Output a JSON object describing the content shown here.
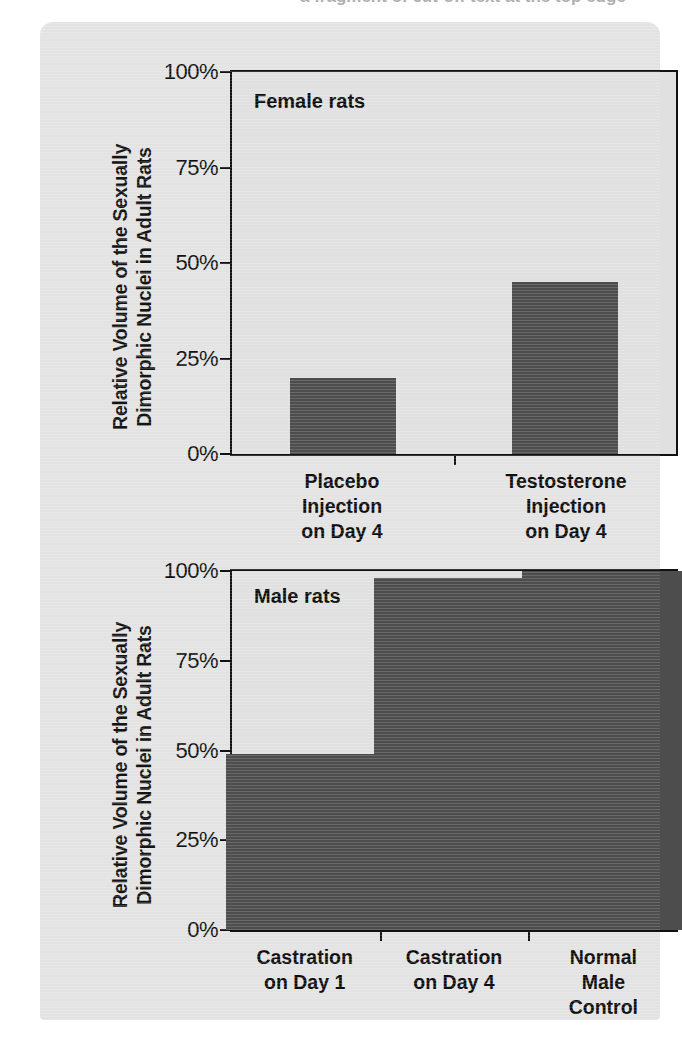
{
  "page": {
    "clipped_header_text": "a fragment of cut-off text at the top edge",
    "card_color": "#e3e3e3",
    "bar_color": "#4d4d4d",
    "plot_background": "#e0e0e0",
    "axis_color": "#111111"
  },
  "y_axis": {
    "title_line1": "Relative Volume of the Sexually",
    "title_line2": "Dimorphic Nuclei in Adult Rats",
    "ticks": [
      "0%",
      "25%",
      "50%",
      "75%",
      "100%"
    ]
  },
  "chart_data": [
    {
      "type": "bar",
      "title": "Female rats",
      "panel_label": "Female rats",
      "categories": [
        "Placebo Injection on Day 4",
        "Testosterone Injection on Day 4"
      ],
      "category_lines": [
        [
          "Placebo",
          "Injection",
          "on Day 4"
        ],
        [
          "Testosterone",
          "Injection",
          "on Day 4"
        ]
      ],
      "values": [
        20,
        45
      ],
      "xlabel": "",
      "ylabel": "Relative Volume of the Sexually Dimorphic Nuclei in Adult Rats",
      "ylim": [
        0,
        100
      ],
      "ytick_values": [
        0,
        25,
        50,
        75,
        100
      ],
      "ytick_labels": [
        "0%",
        "25%",
        "50%",
        "75%",
        "100%"
      ],
      "grid": false,
      "legend": "none"
    },
    {
      "type": "bar",
      "title": "Male rats",
      "panel_label": "Male rats",
      "categories": [
        "Castration on Day 1",
        "Castration on Day 4",
        "Normal Male Control"
      ],
      "category_lines": [
        [
          "Castration",
          "on Day 1"
        ],
        [
          "Castration",
          "on Day 4"
        ],
        [
          "Normal",
          "Male",
          "Control"
        ]
      ],
      "values": [
        49,
        98,
        100
      ],
      "xlabel": "",
      "ylabel": "Relative Volume of the Sexually Dimorphic Nuclei in Adult Rats",
      "ylim": [
        0,
        100
      ],
      "ytick_values": [
        0,
        25,
        50,
        75,
        100
      ],
      "ytick_labels": [
        "0%",
        "25%",
        "50%",
        "75%",
        "100%"
      ],
      "grid": false,
      "legend": "none"
    }
  ]
}
